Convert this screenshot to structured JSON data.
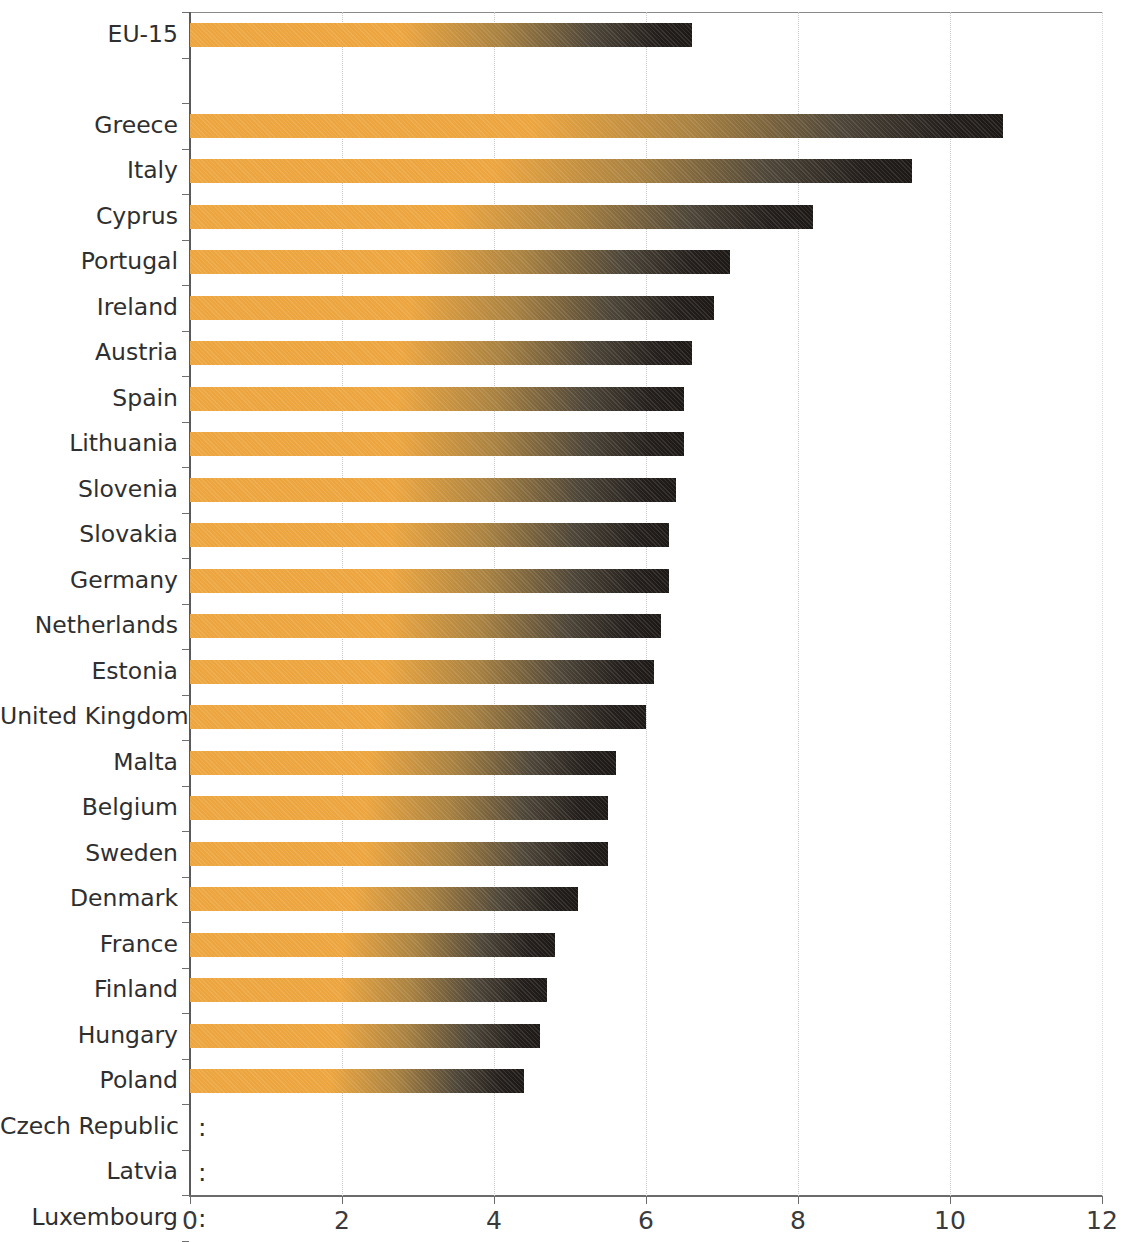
{
  "chart_data": {
    "type": "bar",
    "orientation": "horizontal",
    "title": "",
    "subtitle": "",
    "xlabel": "",
    "ylabel": "",
    "xlim": [
      0,
      12
    ],
    "xticks": [
      0,
      2,
      4,
      6,
      8,
      10,
      12
    ],
    "xtick_labels": [
      "0",
      "2",
      "4",
      "6",
      "8",
      "10",
      "12"
    ],
    "grid": "vertical-dotted",
    "legend": "none",
    "missing_marker": ":",
    "bar_color_start": "#EDA63F",
    "bar_color_end": "#1D1916",
    "categories": [
      "EU-15",
      "",
      "Greece",
      "Italy",
      "Cyprus",
      "Portugal",
      "Ireland",
      "Austria",
      "Spain",
      "Lithuania",
      "Slovenia",
      "Slovakia",
      "Germany",
      "Netherlands",
      "Estonia",
      "United Kingdom",
      "Malta",
      "Belgium",
      "Sweden",
      "Denmark",
      "France",
      "Finland",
      "Hungary",
      "Poland",
      "Czech Republic",
      "Latvia",
      "Luxembourg"
    ],
    "values": [
      6.6,
      null,
      10.7,
      9.5,
      8.2,
      7.1,
      6.9,
      6.6,
      6.5,
      6.5,
      6.4,
      6.3,
      6.3,
      6.2,
      6.1,
      6.0,
      5.6,
      5.5,
      5.5,
      5.1,
      4.8,
      4.7,
      4.6,
      4.4,
      null,
      null,
      null
    ],
    "rows": [
      {
        "label": "EU-15",
        "value": 6.6,
        "missing": false
      },
      {
        "label": "",
        "value": null,
        "missing": false
      },
      {
        "label": "Greece",
        "value": 10.7,
        "missing": false
      },
      {
        "label": "Italy",
        "value": 9.5,
        "missing": false
      },
      {
        "label": "Cyprus",
        "value": 8.2,
        "missing": false
      },
      {
        "label": "Portugal",
        "value": 7.1,
        "missing": false
      },
      {
        "label": "Ireland",
        "value": 6.9,
        "missing": false
      },
      {
        "label": "Austria",
        "value": 6.6,
        "missing": false
      },
      {
        "label": "Spain",
        "value": 6.5,
        "missing": false
      },
      {
        "label": "Lithuania",
        "value": 6.5,
        "missing": false
      },
      {
        "label": "Slovenia",
        "value": 6.4,
        "missing": false
      },
      {
        "label": "Slovakia",
        "value": 6.3,
        "missing": false
      },
      {
        "label": "Germany",
        "value": 6.3,
        "missing": false
      },
      {
        "label": "Netherlands",
        "value": 6.2,
        "missing": false
      },
      {
        "label": "Estonia",
        "value": 6.1,
        "missing": false
      },
      {
        "label": "United Kingdom",
        "value": 6.0,
        "missing": false
      },
      {
        "label": "Malta",
        "value": 5.6,
        "missing": false
      },
      {
        "label": "Belgium",
        "value": 5.5,
        "missing": false
      },
      {
        "label": "Sweden",
        "value": 5.5,
        "missing": false
      },
      {
        "label": "Denmark",
        "value": 5.1,
        "missing": false
      },
      {
        "label": "France",
        "value": 4.8,
        "missing": false
      },
      {
        "label": "Finland",
        "value": 4.7,
        "missing": false
      },
      {
        "label": "Hungary",
        "value": 4.6,
        "missing": false
      },
      {
        "label": "Poland",
        "value": 4.4,
        "missing": false
      },
      {
        "label": "Czech Republic",
        "value": null,
        "missing": true
      },
      {
        "label": "Latvia",
        "value": null,
        "missing": true
      },
      {
        "label": "Luxembourg",
        "value": null,
        "missing": true
      }
    ]
  }
}
